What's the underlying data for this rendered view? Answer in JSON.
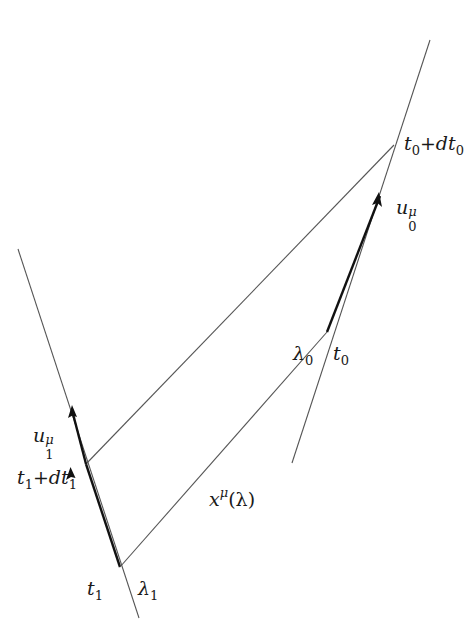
{
  "diagram": {
    "type": "spacetime-worldlines",
    "colors": {
      "background": "#ffffff",
      "thin_line": "#555555",
      "thick_line": "#111111",
      "text": "#1a1a1a"
    },
    "worldlines": [
      {
        "id": "worldline-1",
        "start": [
          18,
          249
        ],
        "end": [
          139,
          618
        ],
        "thick_segment": {
          "from": [
            120,
            567
          ],
          "to": [
            67,
            405
          ]
        },
        "arrow_tip": [
          70,
          468
        ],
        "velocity_label": {
          "base": "u",
          "sub": "1",
          "sup": "μ"
        }
      },
      {
        "id": "worldline-0",
        "start": [
          430,
          40
        ],
        "end": [
          292,
          463
        ],
        "thick_segment": {
          "from": [
            327,
            332
          ],
          "to": [
            394,
            145
          ]
        },
        "arrow_tip": [
          378,
          196
        ],
        "velocity_label": {
          "base": "u",
          "sub": "0",
          "sup": "μ"
        }
      }
    ],
    "null_rays": [
      {
        "id": "ray-lower",
        "from": [
          120,
          567
        ],
        "to": [
          327,
          332
        ],
        "label": "x^μ(λ)"
      },
      {
        "id": "ray-upper",
        "from": [
          86,
          464
        ],
        "to": [
          394,
          145
        ]
      }
    ],
    "labels": {
      "t0_plus_dt0": {
        "base": "t",
        "sub": "0",
        "op": "+",
        "d": "dt",
        "sub2": "0"
      },
      "u0": {
        "base": "u",
        "sub": "0",
        "sup": "μ"
      },
      "lambda0": {
        "base": "λ",
        "sub": "0"
      },
      "t0": {
        "base": "t",
        "sub": "0"
      },
      "u1": {
        "base": "u",
        "sub": "1",
        "sup": "μ"
      },
      "t1_plus_dt1": {
        "base": "t",
        "sub": "1",
        "op": "+",
        "d": "dt",
        "sub2": "1"
      },
      "x_lambda": {
        "base": "x",
        "sup": "μ",
        "arg": "(λ)"
      },
      "t1": {
        "base": "t",
        "sub": "1"
      },
      "lambda1": {
        "base": "λ",
        "sub": "1"
      }
    }
  }
}
